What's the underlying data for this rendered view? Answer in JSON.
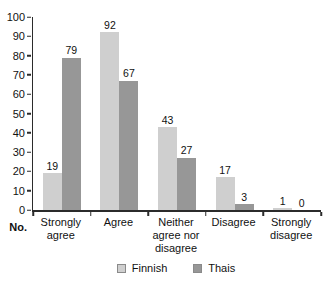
{
  "chart_data": {
    "type": "bar",
    "title": "",
    "xlabel": "",
    "ylabel": "No.",
    "ylim": [
      0,
      100
    ],
    "yticks": [
      0,
      10,
      20,
      30,
      40,
      50,
      60,
      70,
      80,
      90,
      100
    ],
    "grid": false,
    "legend_position": "bottom-center",
    "categories": [
      "Strongly agree",
      "Agree",
      "Neither agree nor disagree",
      "Disagree",
      "Strongly disagree"
    ],
    "series": [
      {
        "name": "Finnish",
        "color": "#cfcfcf",
        "values": [
          19,
          92,
          43,
          17,
          1
        ]
      },
      {
        "name": "Thais",
        "color": "#979797",
        "values": [
          79,
          67,
          27,
          3,
          0
        ]
      }
    ]
  }
}
